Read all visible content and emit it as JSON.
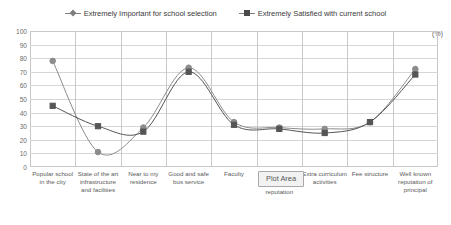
{
  "chart_data": {
    "type": "line",
    "title": "",
    "xlabel": "",
    "ylabel": "",
    "unit_label": "(%)",
    "ylim": [
      0,
      100
    ],
    "ytick_step": 10,
    "yticks": [
      "100",
      "90",
      "80",
      "70",
      "60",
      "50",
      "40",
      "30",
      "20",
      "10",
      "0"
    ],
    "grid": true,
    "legend_position": "top",
    "categories": [
      "Popular school in the city",
      "State of the art infrastructure and facilities",
      "Near to my residence",
      "Good and safe bus service",
      "Faculty",
      "reputation",
      "Extra curriculum activities",
      "Fee structure",
      "Well known reputation of principal"
    ],
    "series": [
      {
        "name": "Extremely Important for school selection",
        "marker": "diamond",
        "color": "#8c8c8c",
        "values": [
          78,
          11,
          29,
          73,
          33,
          29,
          28,
          33,
          72
        ]
      },
      {
        "name": "Extremely Satisfied with current school",
        "marker": "square",
        "color": "#555555",
        "values": [
          45,
          30,
          26,
          70,
          31,
          28,
          25,
          33,
          68
        ]
      }
    ]
  },
  "overlay": {
    "plot_area_tooltip": "Plot Area"
  }
}
